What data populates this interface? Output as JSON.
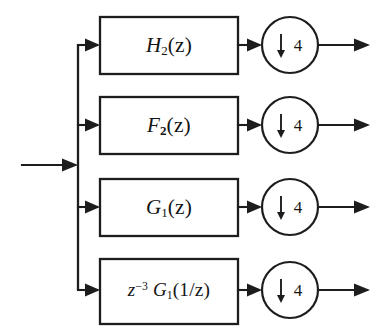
{
  "diagram": {
    "type": "signal-flow-block-diagram",
    "background_color": "#ffffff",
    "line_color": "#1d1d1d",
    "input": {
      "name": "input-signal",
      "label": ""
    },
    "branches": [
      {
        "id": "branch-1",
        "filter_label": "H2(z)",
        "filter_base": "H",
        "filter_subscript": "2",
        "filter_argument": "(z)",
        "subscript_bold": false,
        "downsampler_label": "4",
        "downsampler_symbol": "↓",
        "downsampler_text": "↓4",
        "output_label": ""
      },
      {
        "id": "branch-2",
        "filter_label": "F2(z)",
        "filter_base": "F",
        "filter_subscript": "2",
        "filter_argument": "(z)",
        "subscript_bold": true,
        "downsampler_label": "4",
        "downsampler_symbol": "↓",
        "downsampler_text": "↓4",
        "output_label": ""
      },
      {
        "id": "branch-3",
        "filter_label": "G1(z)",
        "filter_base": "G",
        "filter_subscript": "1",
        "filter_argument": "(z)",
        "subscript_bold": false,
        "downsampler_label": "4",
        "downsampler_symbol": "↓",
        "downsampler_text": "↓4",
        "output_label": ""
      },
      {
        "id": "branch-4",
        "filter_label": "z^-3 G1(1/z)",
        "filter_prefix_base": "z",
        "filter_prefix_exponent": "−3",
        "filter_base": "G",
        "filter_subscript": "1",
        "filter_argument": "(1/z)",
        "subscript_bold": false,
        "downsampler_label": "4",
        "downsampler_symbol": "↓",
        "downsampler_text": "↓4",
        "output_label": ""
      }
    ]
  }
}
